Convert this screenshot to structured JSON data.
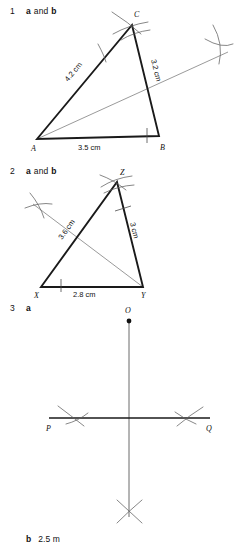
{
  "page": {
    "background": "#ffffff",
    "ink": "#1a1a1a",
    "construction_ink": "#6f6f6f"
  },
  "questions": [
    {
      "number": "1",
      "parts_label_a": "a",
      "conjunction": "and",
      "parts_label_b": "b"
    },
    {
      "number": "2",
      "parts_label_a": "a",
      "conjunction": "and",
      "parts_label_b": "b"
    },
    {
      "number": "3",
      "parts_label_a": "a"
    }
  ],
  "figure1": {
    "name": "triangle-abc-with-angle-bisector",
    "vertices": {
      "a": "A",
      "b": "B",
      "c": "C"
    },
    "side_labels": {
      "ac": "4.2 cm",
      "cb": "3.2 cm",
      "ab": "3.5 cm"
    }
  },
  "figure2": {
    "name": "triangle-xyz-with-bisector",
    "vertices": {
      "x": "X",
      "y": "Y",
      "z": "Z"
    },
    "side_labels": {
      "xz": "3.6 cm",
      "zy": "3 cm",
      "xy": "2.8 cm"
    }
  },
  "figure3": {
    "name": "perpendicular-from-point-to-line",
    "point_label": "O",
    "line_start_label": "P",
    "line_end_label": "Q"
  },
  "answer3b": {
    "label": "b",
    "value": "2.5 m"
  }
}
